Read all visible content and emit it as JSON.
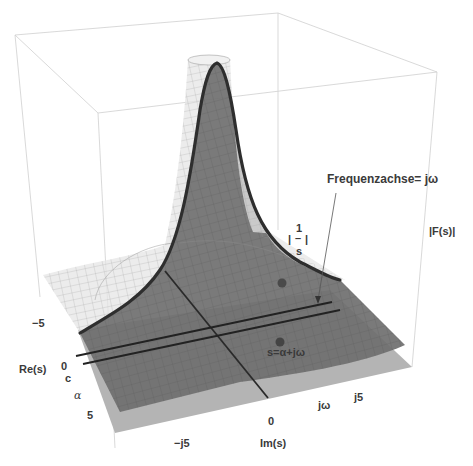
{
  "figure": {
    "surface_label": {
      "num": "1",
      "bar": "–",
      "den": "s",
      "pipe": "|"
    },
    "vertical_axis_label": "|F(s)|",
    "annotation_frequency_axis": "Frequenzachse= jω",
    "annotation_point": "s=α+jω",
    "real_axis": {
      "title": "Re(s)",
      "ticks": [
        "−5",
        "0",
        "5"
      ],
      "symbol_c": "c",
      "symbol_alpha": "α"
    },
    "imag_axis": {
      "title": "Im(s)",
      "ticks": [
        "−j5",
        "0",
        "j5"
      ],
      "symbol_jw": "jω"
    }
  },
  "colors": {
    "background": "#ffffff",
    "box_edge": "#c8c8c8",
    "mesh_surface": "#d9d9d9",
    "dark_surface": "#6e6e6e",
    "base_plane": "#a8a8a8",
    "curve": "#2e2e2e",
    "point": "#444444",
    "text": "#3a3a3a"
  }
}
